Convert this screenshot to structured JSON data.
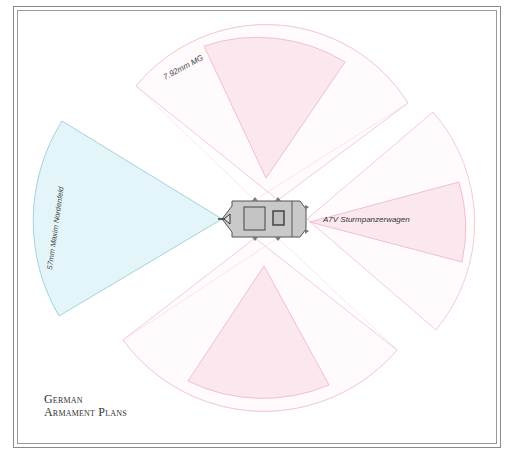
{
  "title": {
    "line1": "German",
    "line2": "Armament Plans"
  },
  "vehicle": {
    "name": "A7V Sturmpanzerwagen"
  },
  "weapons": {
    "main_gun": {
      "label": "57mm Maxim Nordenfeld",
      "color": "#bfe3ec"
    },
    "machine_gun": {
      "label": "7.92mm MG",
      "color": "#f3c4d2"
    }
  },
  "colors": {
    "mg_fill": "#fbeaf0",
    "mg_stroke": "#f2c6c8",
    "gun_fill": "#e3f4f8",
    "gun_stroke": "#9fcfdd",
    "hull_fill": "#c8c8c8",
    "hull_stroke": "#555555"
  }
}
